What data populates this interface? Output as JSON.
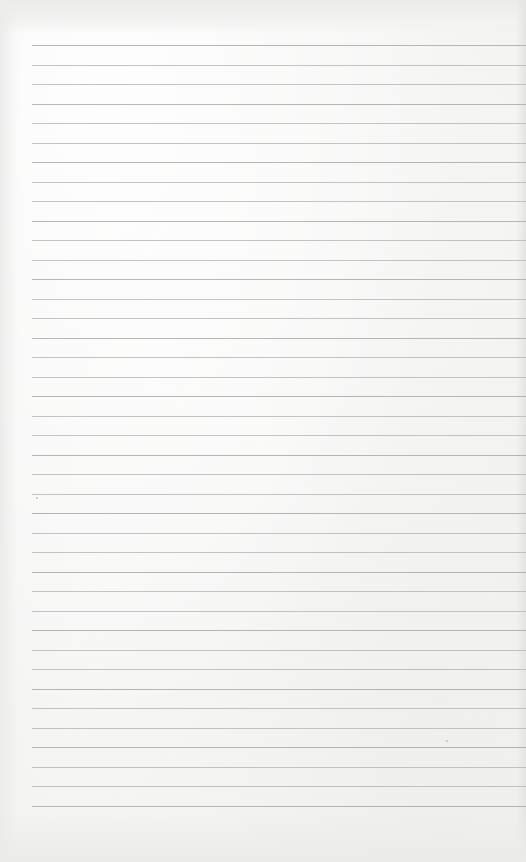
{
  "page": {
    "type": "lined-paper",
    "background_color": "#f6f6f5",
    "rule_color": "#b9b9b8",
    "rule_count": 40,
    "rule_start_y": 45,
    "rule_spacing": 19.5,
    "rule_left_x": 32
  }
}
